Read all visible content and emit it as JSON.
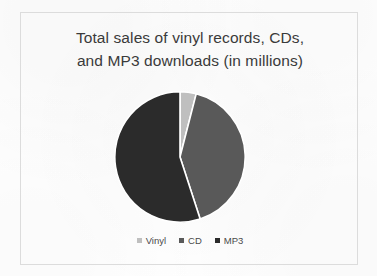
{
  "chart_data": {
    "type": "pie",
    "title": "Total sales of vinyl records, CDs,\nand MP3 downloads (in millions)",
    "title_line_1": "Total sales of vinyl records, CDs,",
    "title_line_2": "and MP3 downloads (in millions)",
    "categories": [
      "Vinyl",
      "CD",
      "MP3"
    ],
    "values": [
      4,
      41,
      55
    ],
    "value_unit": "millions",
    "slices": [
      {
        "label": "Vinyl",
        "value": 4,
        "percent": 4,
        "color": "#bfbfbf",
        "start_angle": 0,
        "end_angle": 14.4
      },
      {
        "label": "CD",
        "value": 41,
        "percent": 41,
        "color": "#595959",
        "start_angle": 14.4,
        "end_angle": 162.0
      },
      {
        "label": "MP3",
        "value": 55,
        "percent": 55,
        "color": "#2b2b2b",
        "start_angle": 162.0,
        "end_angle": 360.0
      }
    ],
    "legend": {
      "position": "bottom",
      "entries": [
        {
          "label": "Vinyl",
          "color": "#bfbfbf"
        },
        {
          "label": "CD",
          "color": "#595959"
        },
        {
          "label": "MP3",
          "color": "#2b2b2b"
        }
      ]
    },
    "data_labels_shown": false,
    "grid": false,
    "xlabel": "",
    "ylabel": ""
  },
  "frame": {
    "border_color": "#dcdcdc",
    "background": "#ffffff"
  }
}
